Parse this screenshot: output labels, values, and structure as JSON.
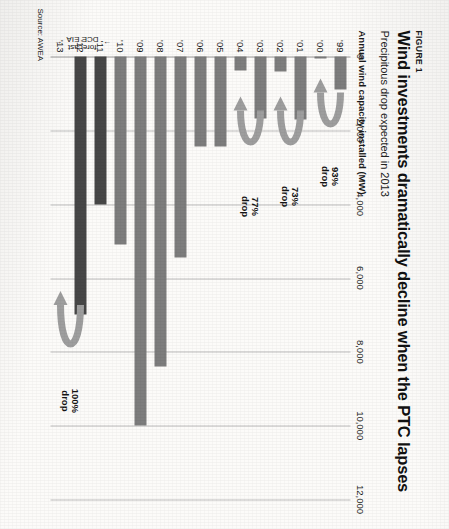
{
  "figure": {
    "kicker": "FIGURE 1",
    "title": "Wind investments dramatically decline when the PTC lapses",
    "subtitle": "Precipitous drop expected in 2013",
    "axis_title": "Annual wind capacity installed (MW)",
    "source": "Source: AWEA",
    "forecast_label_line1": "DCE EIA",
    "forecast_label_line2": "forecast",
    "left_arrow": "←",
    "right_arrow": "→"
  },
  "chart_data": {
    "type": "bar",
    "title": "Wind investments dramatically decline when the PTC lapses",
    "subtitle": "Precipitous drop expected in 2013",
    "xlabel": "",
    "ylabel": "Annual wind capacity installed (MW)",
    "orientation": "horizontal",
    "ylim": [
      0,
      12000
    ],
    "grid": true,
    "legend": "none",
    "tick_labels": [
      "0",
      "2,000",
      "4,000",
      "6,000",
      "8,000",
      "10,000",
      "12,000"
    ],
    "tick_values": [
      0,
      2000,
      4000,
      6000,
      8000,
      10000,
      12000
    ],
    "categories": [
      "'99",
      "'00",
      "'01",
      "'02",
      "'03",
      "'04",
      "'05",
      "'06",
      "'07",
      "'08",
      "'09",
      "'10",
      "'11",
      "'12",
      "'13"
    ],
    "values": [
      900,
      60,
      1700,
      410,
      1690,
      390,
      2430,
      2450,
      5450,
      8400,
      10000,
      5100,
      4000,
      7000,
      0
    ],
    "series_style": [
      "actual",
      "actual",
      "actual",
      "actual",
      "actual",
      "actual",
      "actual",
      "actual",
      "actual",
      "actual",
      "actual",
      "actual",
      "forecast",
      "forecast",
      "forecast"
    ],
    "colors": {
      "actual": "#7d7d7d",
      "forecast": "#474747",
      "gridline": "#bdbdbd",
      "arrow": "#9e9e9e"
    },
    "annotations": [
      {
        "id": "drop-93",
        "pct": "93%",
        "word": "drop",
        "from": "'99",
        "to": "'00"
      },
      {
        "id": "drop-73",
        "pct": "73%",
        "word": "drop",
        "from": "'01",
        "to": "'02"
      },
      {
        "id": "drop-77",
        "pct": "77%",
        "word": "drop",
        "from": "'03",
        "to": "'04"
      },
      {
        "id": "drop-100",
        "pct": "100%",
        "word": "drop",
        "from": "'12",
        "to": "'13"
      }
    ],
    "forecast_bracket": {
      "label": "DCE EIA forecast",
      "from": "'11",
      "to": "'13"
    },
    "source": "Source: AWEA"
  }
}
